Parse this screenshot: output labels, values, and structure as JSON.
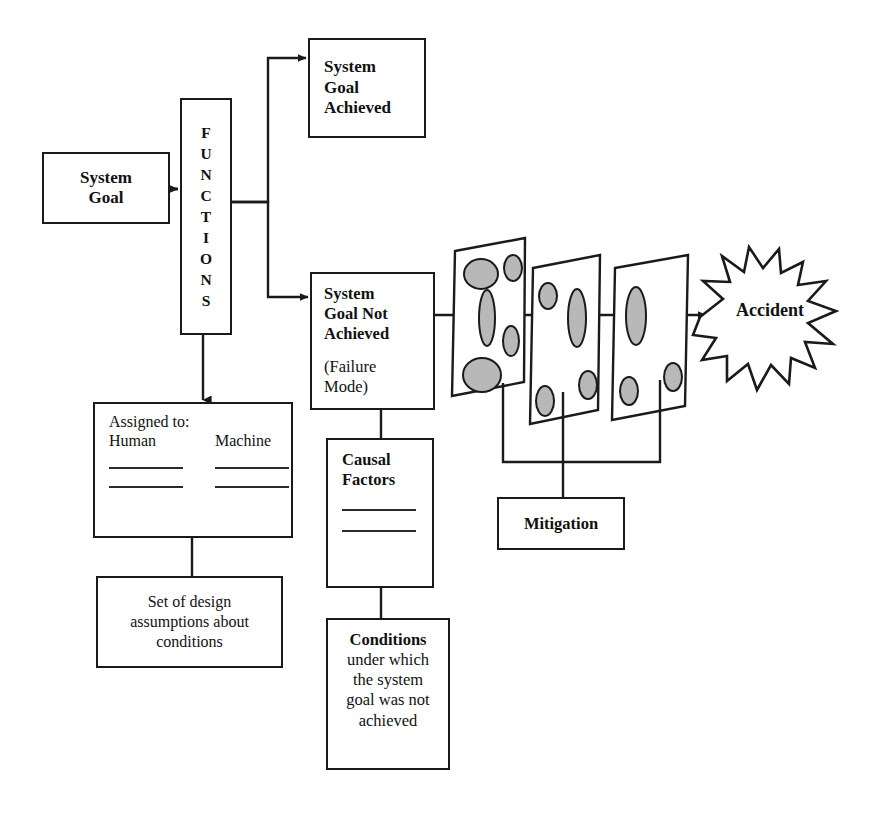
{
  "diagram": {
    "colors": {
      "stroke": "#1a1a1a",
      "hole_fill": "#b8b8b8",
      "slice_fill": "#ffffff",
      "background": "#ffffff"
    },
    "nodes": {
      "system_goal": {
        "label": "System\nGoal",
        "line1": "System",
        "line2": "Goal"
      },
      "functions": {
        "label": "FUNCTIONS",
        "letters": [
          "F",
          "U",
          "N",
          "C",
          "T",
          "I",
          "O",
          "N",
          "S"
        ]
      },
      "goal_achieved": {
        "line1": "System",
        "line2": "Goal",
        "line3": "Achieved"
      },
      "goal_not_achieved": {
        "line1": "System",
        "line2": "Goal Not",
        "line3": "Achieved",
        "sub_line1": "(Failure",
        "sub_line2": "Mode)"
      },
      "assigned": {
        "title": "Assigned to:",
        "columns": [
          "Human",
          "Machine"
        ],
        "rule_rows": 2
      },
      "design_assumptions": {
        "line1": "Set of design",
        "line2": "assumptions about",
        "line3": "conditions"
      },
      "causal_factors": {
        "line1": "Causal",
        "line2": "Factors",
        "rule_rows": 2
      },
      "conditions": {
        "head": "Conditions",
        "line1": "under which",
        "line2": "the system",
        "line3": "goal was not",
        "line4": "achieved"
      },
      "mitigation": {
        "label": "Mitigation"
      },
      "accident": {
        "label": "Accident"
      }
    },
    "barriers": {
      "name": "swiss-cheese-barrier-slices",
      "count": 3,
      "hole_counts": [
        5,
        4,
        3
      ]
    }
  }
}
